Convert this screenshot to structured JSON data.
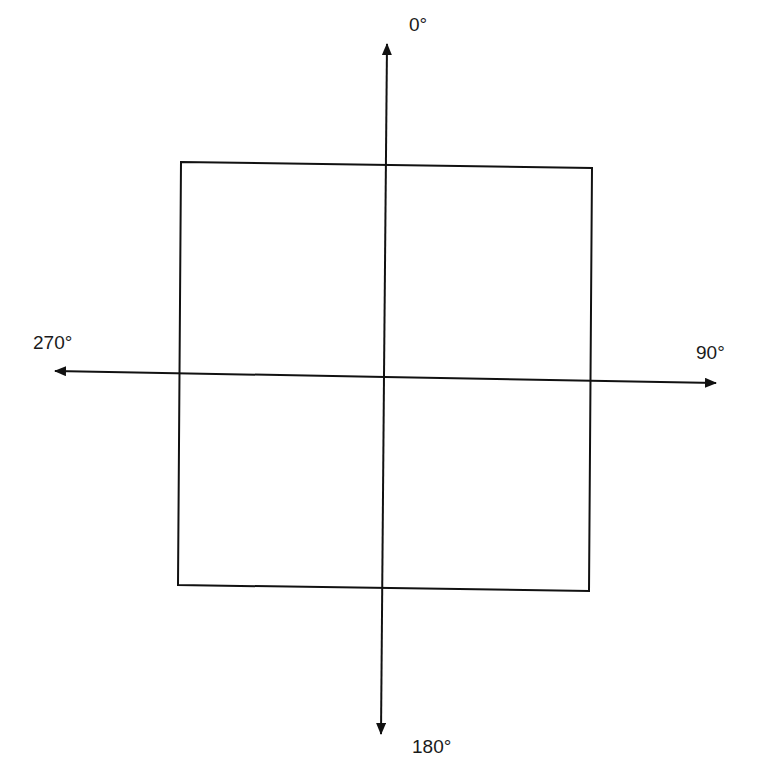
{
  "diagram": {
    "type": "orientation-axes",
    "stroke_color": "#111111",
    "background": "#ffffff",
    "labels": {
      "top": "0°",
      "right": "90°",
      "bottom": "180°",
      "left": "270°"
    },
    "square": {
      "corners": {
        "top_left": [
          181,
          162
        ],
        "top_right": [
          592,
          168
        ],
        "bottom_right": [
          589,
          591
        ],
        "bottom_left": [
          178,
          585
        ]
      }
    },
    "axes": {
      "vertical": {
        "from": [
          387,
          44
        ],
        "to": [
          381,
          734
        ]
      },
      "horizontal": {
        "from": [
          55,
          371
        ],
        "to": [
          716,
          383
        ]
      }
    }
  }
}
